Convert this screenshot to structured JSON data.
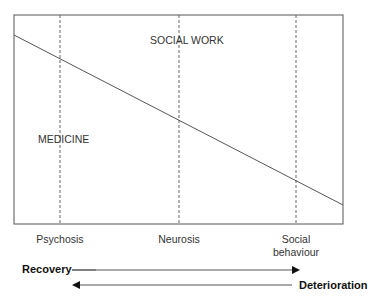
{
  "diagram": {
    "regions": {
      "upper": "SOCIAL WORK",
      "lower": "MEDICINE"
    },
    "categories": [
      {
        "label": "Psychosis",
        "x": 60
      },
      {
        "label": "Neurosis",
        "x": 179
      },
      {
        "label": "Social behaviour",
        "line1": "Social",
        "line2": "behaviour",
        "x": 296
      }
    ],
    "arrows": {
      "forward": {
        "label": "Recovery",
        "direction": "right"
      },
      "backward": {
        "label": "Deterioration",
        "direction": "left"
      }
    },
    "colors": {
      "line": "#555555",
      "text": "#222222"
    }
  }
}
